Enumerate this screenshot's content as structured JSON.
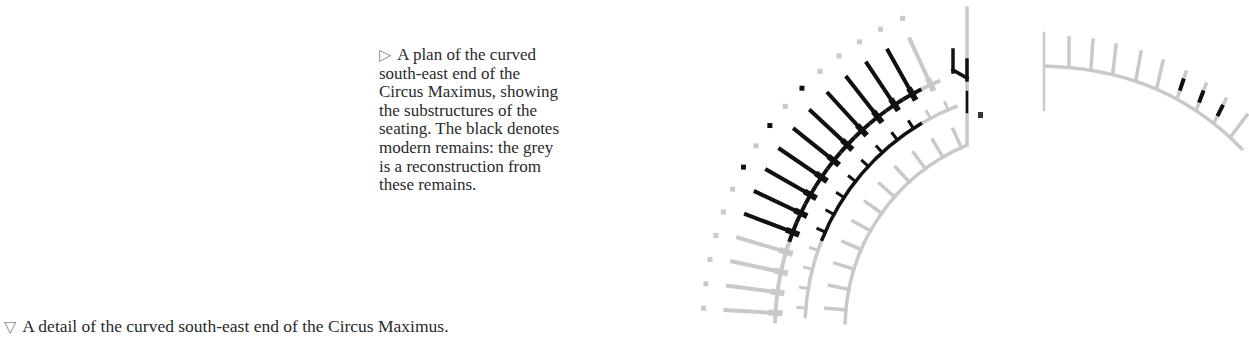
{
  "captions": {
    "side": {
      "marker": "▷",
      "lines": [
        "A plan of the curved",
        "south-east end of the",
        "Circus Maximus, showing",
        "the substructures of the",
        "seating. The black denotes",
        "modern remains: the grey",
        "is a reconstruction from",
        "these remains."
      ]
    },
    "bottom": {
      "marker": "▽",
      "text": "A detail of the curved south-east end of the Circus Maximus."
    }
  },
  "figure": {
    "legend": {
      "black": "modern remains",
      "grey": "reconstruction"
    },
    "colors": {
      "black": "#111111",
      "grey": "#c9c9c9"
    },
    "main_plan": {
      "center": [
        1043,
        328
      ],
      "inner_wall_r": 198,
      "pier_ring_r": 238,
      "wall_ring_r": 268,
      "outer_wall_r": 318,
      "dot_r": 340,
      "top_line": {
        "x": 967,
        "y1": 8,
        "y2": 145
      }
    },
    "detail_plan": {
      "top_line": {
        "x": 1044,
        "y1": 33,
        "y2": 110
      }
    }
  }
}
